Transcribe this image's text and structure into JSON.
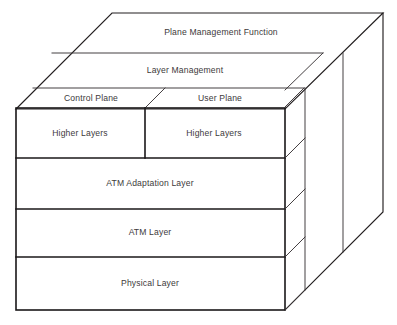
{
  "diagram": {
    "type": "isometric-layered-cube",
    "stroke_color": "#231f20",
    "face_color": "#ffffff",
    "background_color": "#ffffff",
    "top_bands": [
      {
        "id": "plane-management-function",
        "label": "Plane Management Function"
      },
      {
        "id": "layer-management",
        "label": "Layer Management"
      }
    ],
    "planes": [
      {
        "id": "control-plane",
        "label": "Control Plane"
      },
      {
        "id": "user-plane",
        "label": "User Plane"
      }
    ],
    "front_layers": [
      {
        "id": "higher-layers-control",
        "label": "Higher Layers",
        "plane": "control-plane"
      },
      {
        "id": "higher-layers-user",
        "label": "Higher Layers",
        "plane": "user-plane"
      },
      {
        "id": "atm-adaptation-layer",
        "label": "ATM Adaptation Layer",
        "plane": "both"
      },
      {
        "id": "atm-layer",
        "label": "ATM Layer",
        "plane": "both"
      },
      {
        "id": "physical-layer",
        "label": "Physical Layer",
        "plane": "both"
      }
    ]
  }
}
